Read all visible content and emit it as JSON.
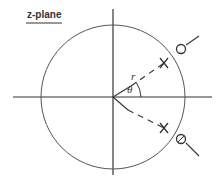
{
  "diagram": {
    "title": "z-plane",
    "labels": {
      "radius": "r",
      "angle": "θ"
    },
    "unit_circle": {
      "cx": 113,
      "cy": 97,
      "r": 72
    },
    "markers": [
      {
        "type": "zero",
        "symbol": "circle",
        "position": "upper",
        "on_unit_circle": true
      },
      {
        "type": "pole",
        "symbol": "x",
        "position": "upper",
        "radius_label": "r",
        "angle_label": "θ"
      },
      {
        "type": "zero",
        "symbol": "circle",
        "position": "lower",
        "on_unit_circle": true
      },
      {
        "type": "pole",
        "symbol": "x",
        "position": "lower"
      }
    ],
    "colors": {
      "stroke": "#333333",
      "background": "#ffffff"
    }
  }
}
